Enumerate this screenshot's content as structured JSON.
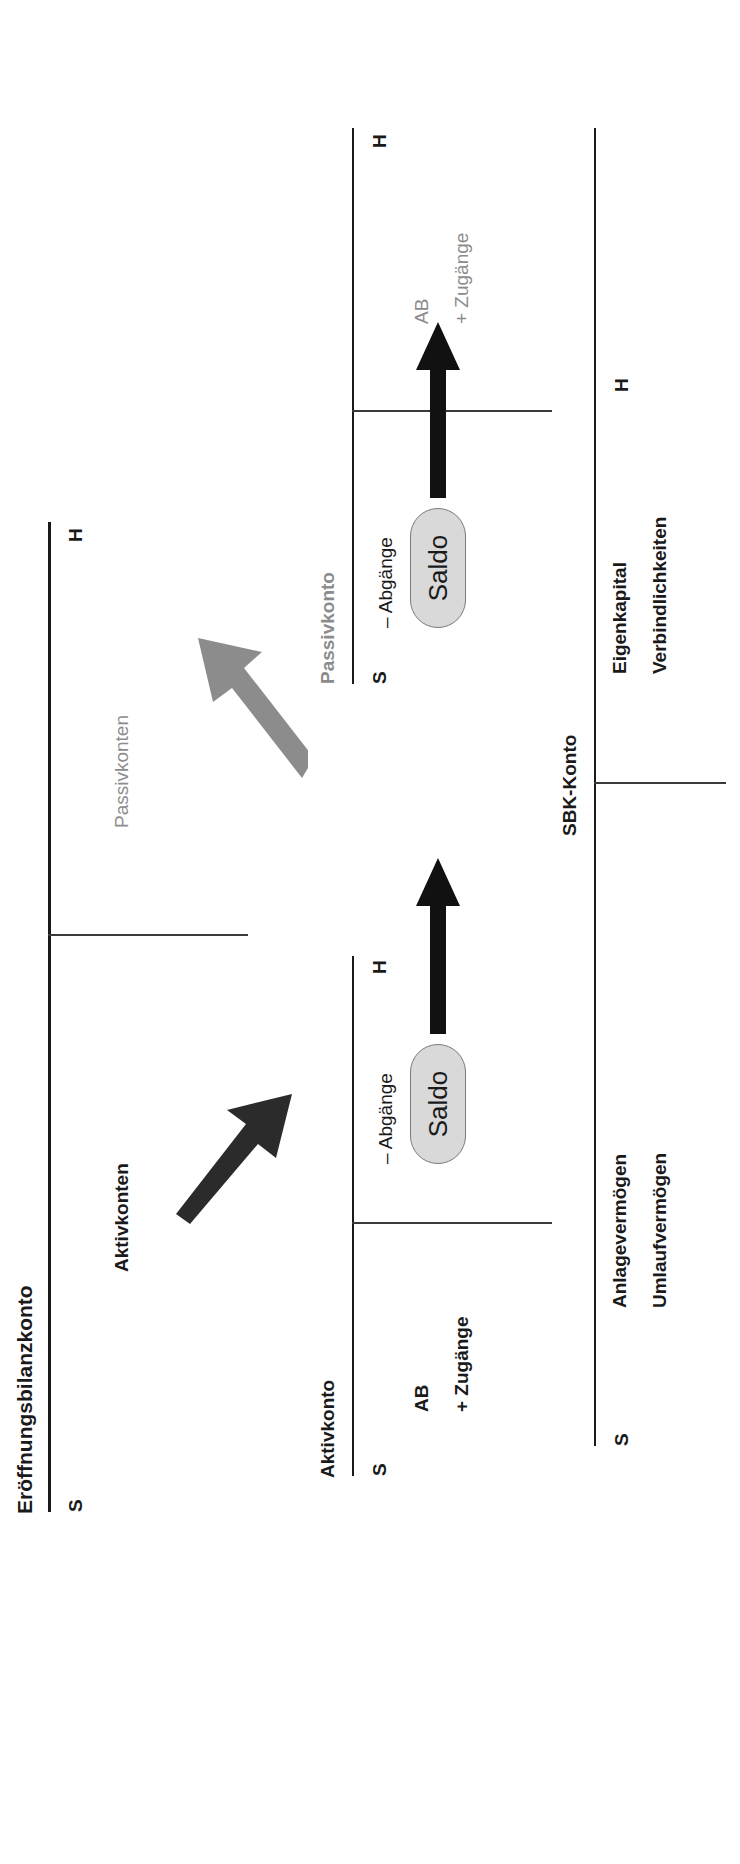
{
  "diagram": {
    "language": "de"
  },
  "ebk_account": {
    "name": "Eröffnungsbilanzkonto",
    "debit_side_marker": "S",
    "credit_side_marker": "H",
    "debit_entry": "Aktivkonten",
    "credit_entry": "Passivkonten"
  },
  "aktivkonto": {
    "name": "Aktivkonto",
    "debit_side_marker": "S",
    "credit_side_marker": "H",
    "debit_entries": [
      "AB",
      "+ Zugänge"
    ],
    "credit_entries": [
      "– Abgänge"
    ],
    "balance_label": "Saldo"
  },
  "passivkonto": {
    "name": "Passivkonto",
    "debit_side_marker": "S",
    "credit_side_marker": "H",
    "credit_entries": [
      "AB",
      "+ Zugänge"
    ],
    "debit_entries": [
      "– Abgänge"
    ],
    "balance_label": "Saldo"
  },
  "sbk_account": {
    "name": "SBK-Konto",
    "debit_side_marker": "S",
    "credit_side_marker": "H",
    "debit_entries": [
      "Anlagevermögen",
      "Umlaufvermögen"
    ],
    "credit_entries": [
      "Eigenkapital",
      "Verbindlichkeiten"
    ]
  },
  "arrows": {
    "ebk_to_aktivkonto": "black-diagonal-arrow",
    "ebk_to_passivkonto": "gray-diagonal-arrow",
    "aktivkonto_saldo_to_sbk": "black-straight-arrow",
    "passivkonto_saldo_to_sbk": "black-straight-arrow"
  },
  "colors": {
    "ink": "#1a1a1a",
    "muted": "#8c8c8c",
    "pill_fill": "#d9d9d9",
    "pill_stroke": "#7a7a7a"
  }
}
